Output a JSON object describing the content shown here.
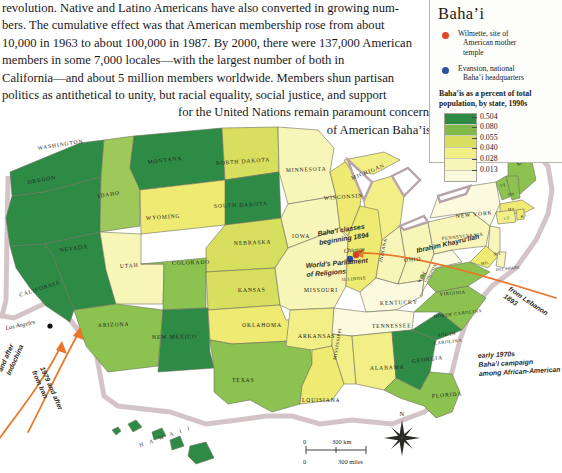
{
  "prose": {
    "lines": [
      "revolution. Native and Latino Americans have also converted in growing num-",
      "bers. The cumulative effect was that American membership rose from about",
      "10,000 in 1963 to about 100,000 in 1987. By 2000, there were 137,000 American",
      "members in some 7,000 locales—with the largest number of both in",
      "California—and about 5 million members worldwide. Members shun partisan",
      "politics as antithetical to unity, but racial equality, social justice, and support"
    ],
    "ragged": [
      "for the United Nations remain paramount concerns",
      "of American Baha’is."
    ]
  },
  "legend": {
    "title": "Baha’i",
    "markers": [
      {
        "color": "#e0462a",
        "name": "wilmette-marker",
        "line1": "Wilmette, site of",
        "line2": "American mother",
        "line3": "temple"
      },
      {
        "color": "#2b4d9b",
        "name": "evanston-marker",
        "line1": "Evanston, national",
        "line2": "Baha’i headquarters",
        "line3": ""
      }
    ],
    "caption_line1": "Baha’is as a percent of total",
    "caption_line2": "population, by state, 1990s",
    "scale": [
      {
        "color": "#2e8b46",
        "value": "0.504"
      },
      {
        "color": "#7fba4a",
        "value": "0.080"
      },
      {
        "color": "#d8de5e",
        "value": "0.055"
      },
      {
        "color": "#f2ef86",
        "value": "0.040"
      },
      {
        "color": "#f8f5b8",
        "value": "0.028"
      },
      {
        "color": "#fbfade",
        "value": "0.013"
      }
    ]
  },
  "chart_data": {
    "type": "map",
    "title": "Baha’is as a percent of total population, by state, 1990s",
    "legend_position": "top-right",
    "bins": [
      "0.013",
      "0.028",
      "0.040",
      "0.055",
      "0.080",
      "0.504"
    ],
    "bin_colors": [
      "#fbfade",
      "#f8f5b8",
      "#f2ef86",
      "#d8de5e",
      "#7fba4a",
      "#2e8b46"
    ],
    "states": [
      {
        "name": "WASHINGTON",
        "fill": "#2e8b46"
      },
      {
        "name": "OREGON",
        "fill": "#2e8b46"
      },
      {
        "name": "IDAHO",
        "fill": "#9ec95a"
      },
      {
        "name": "MONTANA",
        "fill": "#2e8b46"
      },
      {
        "name": "NORTH DAKOTA",
        "fill": "#d8de5e"
      },
      {
        "name": "SOUTH DAKOTA",
        "fill": "#2e8b46"
      },
      {
        "name": "WYOMING",
        "fill": "#eeea72"
      },
      {
        "name": "NEVADA",
        "fill": "#2e8b46"
      },
      {
        "name": "UTAH",
        "fill": "#f8f5b8"
      },
      {
        "name": "CALIFORNIA",
        "fill": "#2e8b46"
      },
      {
        "name": "COLORADO",
        "fill": "#8cc24f"
      },
      {
        "name": "NEBRASKA",
        "fill": "#d8de5e"
      },
      {
        "name": "KANSAS",
        "fill": "#d8de5e"
      },
      {
        "name": "ARIZONA",
        "fill": "#8cc24f"
      },
      {
        "name": "NEW MEXICO",
        "fill": "#2e8b46"
      },
      {
        "name": "TEXAS",
        "fill": "#8cc24f"
      },
      {
        "name": "OKLAHOMA",
        "fill": "#eeea72"
      },
      {
        "name": "MINNESOTA",
        "fill": "#f8f5b8"
      },
      {
        "name": "IOWA",
        "fill": "#f8f5b8"
      },
      {
        "name": "MISSOURI",
        "fill": "#f8f5b8"
      },
      {
        "name": "ARKANSAS",
        "fill": "#f2ef86"
      },
      {
        "name": "LOUISIANA",
        "fill": "#eeea72"
      },
      {
        "name": "WISCONSIN",
        "fill": "#eeea72"
      },
      {
        "name": "ILLINOIS",
        "fill": "#eeea72"
      },
      {
        "name": "MICHIGAN",
        "fill": "#f2ef86"
      },
      {
        "name": "INDIANA",
        "fill": "#f8f5b8"
      },
      {
        "name": "OHIO",
        "fill": "#f8f5b8"
      },
      {
        "name": "KENTUCKY",
        "fill": "#fbfade"
      },
      {
        "name": "TENNESSEE",
        "fill": "#fbfade"
      },
      {
        "name": "MISSISSIPPI",
        "fill": "#f2ef86"
      },
      {
        "name": "ALABAMA",
        "fill": "#f2ef86"
      },
      {
        "name": "GEORGIA",
        "fill": "#2e8b46"
      },
      {
        "name": "FLORIDA",
        "fill": "#8cc24f"
      },
      {
        "name": "SOUTH CAROLINA",
        "fill": "#2e8b46"
      },
      {
        "name": "NORTH CAROLINA",
        "fill": "#8cc24f"
      },
      {
        "name": "VIRGINIA",
        "fill": "#8cc24f"
      },
      {
        "name": "WEST VIRGINIA",
        "fill": "#fbfade"
      },
      {
        "name": "PENNSYLVANIA",
        "fill": "#f8f5b8"
      },
      {
        "name": "NEW YORK",
        "fill": "#fbfade"
      },
      {
        "name": "MAINE",
        "fill": "#8cc24f"
      },
      {
        "name": "VT",
        "fill": "#8cc24f"
      },
      {
        "name": "NH",
        "fill": "#8cc24f"
      },
      {
        "name": "MA",
        "fill": "#eeea72"
      },
      {
        "name": "CT",
        "fill": "#f2ef86"
      },
      {
        "name": "RI",
        "fill": "#eeea72"
      },
      {
        "name": "NJ",
        "fill": "#f8f5b8"
      },
      {
        "name": "MD",
        "fill": "#eeea72"
      },
      {
        "name": "DELAWARE",
        "fill": "#f8f5b8"
      },
      {
        "name": "HAWAII",
        "fill": "#2e8b46"
      }
    ]
  },
  "map": {
    "states": [
      {
        "label": "WASHINGTON",
        "x": 38,
        "y": 150,
        "rot": -9,
        "cls": "stlabel"
      },
      {
        "label": "OREGON",
        "x": 28,
        "y": 184,
        "rot": -10,
        "cls": "stlabel"
      },
      {
        "label": "IDAHO",
        "x": 98,
        "y": 198,
        "rot": -9,
        "cls": "stlabel"
      },
      {
        "label": "MONTANA",
        "x": 148,
        "y": 164,
        "rot": -7,
        "cls": "stlabel"
      },
      {
        "label": "NORTH DAKOTA",
        "x": 216,
        "y": 165,
        "rot": -4,
        "cls": "stlabel"
      },
      {
        "label": "SOUTH DAKOTA",
        "x": 214,
        "y": 208,
        "rot": -3,
        "cls": "stlabel"
      },
      {
        "label": "WYOMING",
        "x": 146,
        "y": 220,
        "rot": -4,
        "cls": "stlabel"
      },
      {
        "label": "NEBRASKA",
        "x": 234,
        "y": 245,
        "rot": -2,
        "cls": "stlabel"
      },
      {
        "label": "NEVADA",
        "x": 60,
        "y": 252,
        "rot": -8,
        "cls": "stlabel"
      },
      {
        "label": "UTAH",
        "x": 120,
        "y": 268,
        "rot": -4,
        "cls": "stlabel"
      },
      {
        "label": "COLORADO",
        "x": 172,
        "y": 265,
        "rot": -2,
        "cls": "stlabel"
      },
      {
        "label": "CALIFORNIA",
        "x": 20,
        "y": 297,
        "rot": -18,
        "cls": "stlabel"
      },
      {
        "label": "KANSAS",
        "x": 238,
        "y": 292,
        "rot": -1,
        "cls": "stlabel"
      },
      {
        "label": "ARIZONA",
        "x": 98,
        "y": 327,
        "rot": -2,
        "cls": "stlabel"
      },
      {
        "label": "NEW MEXICO",
        "x": 152,
        "y": 339,
        "rot": -1,
        "cls": "stlabel"
      },
      {
        "label": "OKLAHOMA",
        "x": 242,
        "y": 327,
        "rot": 0,
        "cls": "stlabel"
      },
      {
        "label": "TEXAS",
        "x": 232,
        "y": 382,
        "rot": 0,
        "cls": "stlabel"
      },
      {
        "label": "MINNESOTA",
        "x": 286,
        "y": 172,
        "rot": -2,
        "cls": "stlabel"
      },
      {
        "label": "IOWA",
        "x": 292,
        "y": 238,
        "rot": 0,
        "cls": "stlabel"
      },
      {
        "label": "MISSOURI",
        "x": 304,
        "y": 292,
        "rot": 0,
        "cls": "stlabel"
      },
      {
        "label": "ARKANSAS",
        "x": 298,
        "y": 338,
        "rot": 0,
        "cls": "stlabel"
      },
      {
        "label": "LOUISIANA",
        "x": 302,
        "y": 402,
        "rot": 0,
        "cls": "stlabel"
      },
      {
        "label": "WISCONSIN",
        "x": 324,
        "y": 200,
        "rot": -4,
        "cls": "stlabel"
      },
      {
        "label": "MICHIGAN",
        "x": 352,
        "y": 180,
        "rot": -22,
        "cls": "stlabel"
      },
      {
        "label": "ILLINOIS",
        "x": 342,
        "y": 281,
        "rot": -4,
        "cls": "stlabel sm"
      },
      {
        "label": "INDIANA",
        "x": 382,
        "y": 262,
        "rot": -78,
        "cls": "stlabel sm"
      },
      {
        "label": "OHIO",
        "x": 404,
        "y": 262,
        "rot": -5,
        "cls": "stlabel"
      },
      {
        "label": "KENTUCKY",
        "x": 380,
        "y": 305,
        "rot": -2,
        "cls": "stlabel"
      },
      {
        "label": "TENNESSEE",
        "x": 372,
        "y": 328,
        "rot": -1,
        "cls": "stlabel"
      },
      {
        "label": "MISSISSIPPI",
        "x": 336,
        "y": 360,
        "rot": -80,
        "cls": "stlabel sm"
      },
      {
        "label": "ALABAMA",
        "x": 370,
        "y": 370,
        "rot": -2,
        "cls": "stlabel"
      },
      {
        "label": "GEORGIA",
        "x": 412,
        "y": 363,
        "rot": -7,
        "cls": "stlabel"
      },
      {
        "label": "FLORIDA",
        "x": 432,
        "y": 398,
        "rot": -5,
        "cls": "stlabel"
      },
      {
        "label": "SOUTH",
        "x": 438,
        "y": 337,
        "rot": -7,
        "cls": "stlabel sm"
      },
      {
        "label": "CAROLINA",
        "x": 434,
        "y": 345,
        "rot": -7,
        "cls": "stlabel sm"
      },
      {
        "label": "NORTH CAROLINA",
        "x": 434,
        "y": 318,
        "rot": -7,
        "cls": "stlabel sm"
      },
      {
        "label": "VIRGINIA",
        "x": 440,
        "y": 296,
        "rot": -6,
        "cls": "stlabel sm"
      },
      {
        "label": "WEST",
        "x": 420,
        "y": 283,
        "rot": -62,
        "cls": "stlabel xs"
      },
      {
        "label": "VIRGINIA",
        "x": 427,
        "y": 283,
        "rot": -62,
        "cls": "stlabel xs"
      },
      {
        "label": "PENNSYLVANIA",
        "x": 442,
        "y": 240,
        "rot": -6,
        "cls": "stlabel sm"
      },
      {
        "label": "NEW YORK",
        "x": 456,
        "y": 218,
        "rot": -6,
        "cls": "stlabel"
      },
      {
        "label": "MAINE",
        "x": 518,
        "y": 166,
        "rot": -28,
        "cls": "stlabel sm"
      },
      {
        "label": "VT",
        "x": 500,
        "y": 187,
        "rot": -10,
        "cls": "stlabel xs"
      },
      {
        "label": "NH",
        "x": 508,
        "y": 196,
        "rot": -10,
        "cls": "stlabel xs"
      },
      {
        "label": "MA",
        "x": 508,
        "y": 211,
        "rot": -8,
        "cls": "stlabel xs"
      },
      {
        "label": "CT",
        "x": 504,
        "y": 220,
        "rot": -8,
        "cls": "stlabel xs"
      },
      {
        "label": "R.I.",
        "x": 521,
        "y": 218,
        "rot": -20,
        "cls": "stlabel xs"
      },
      {
        "label": "N.J.",
        "x": 494,
        "y": 256,
        "rot": -12,
        "cls": "stlabel xs"
      },
      {
        "label": "MD.",
        "x": 481,
        "y": 265,
        "rot": -8,
        "cls": "stlabel xs"
      },
      {
        "label": "DELAWARE",
        "x": 496,
        "y": 271,
        "rot": -6,
        "cls": "stlabel xs"
      }
    ],
    "annotations": [
      {
        "name": "bahai-classes-note",
        "lines": [
          "Baha’i classes",
          "beginning 1894"
        ],
        "x": 318,
        "y": 236,
        "rot": -9
      },
      {
        "name": "worlds-parliament-note",
        "lines": [
          "World’s Parliament",
          "of Religions"
        ],
        "x": 306,
        "y": 268,
        "rot": -5
      },
      {
        "name": "khayrullah-route-label",
        "lines": [
          "Ibrahim Khayru’llah"
        ],
        "x": 417,
        "y": 253,
        "rot": -13
      },
      {
        "name": "from-lebanon-label",
        "lines": [
          "from Lebanon",
          "1893"
        ],
        "x": 508,
        "y": 290,
        "rot": 34
      },
      {
        "name": "african-american-campaign-note",
        "lines": [
          "early 1970s",
          "Baha’i campaign",
          "among African-American"
        ],
        "x": 478,
        "y": 358,
        "rot": -3
      },
      {
        "name": "from-iran-label",
        "lines": [
          "1979 and after",
          "from Iran"
        ],
        "x": 40,
        "y": 368,
        "rot": 66
      },
      {
        "name": "from-indochina-label",
        "lines": [
          "and after",
          "Indochina"
        ],
        "x": 2,
        "y": 372,
        "rot": -66
      }
    ],
    "cities": [
      {
        "name": "chicago-label",
        "label": "Chicago",
        "x": 344,
        "y": 253,
        "rot": -6
      },
      {
        "name": "los-angeles-label",
        "label": "Los Angeles",
        "x": 6,
        "y": 330,
        "rot": -12
      }
    ],
    "lakes": [],
    "hawaii_label": "H A W A I I",
    "compass_label": "N",
    "scale": {
      "km_zero": "0",
      "km_label": "300 km",
      "mi_zero": "0",
      "mi_label": "300 miles"
    }
  }
}
